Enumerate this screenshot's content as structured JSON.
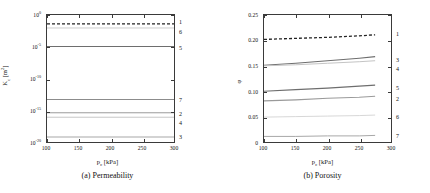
{
  "figure": {
    "panels": [
      {
        "id": "a",
        "caption": "(a) Permeability",
        "xlabel_main": "p",
        "xlabel_sub": "c",
        "xlabel_unit": "[kPa]",
        "ylabel_main": "K",
        "ylabel_sub": "c",
        "ylabel_unit": "[m",
        "ylabel_unit_sup": "2",
        "ylabel_unit_end": "]",
        "xticks": [
          "100",
          "150",
          "200",
          "250",
          "300"
        ],
        "yticks": [
          {
            "mantissa": "10",
            "exp": "0"
          },
          {
            "mantissa": "10",
            "exp": "-5"
          },
          {
            "mantissa": "10",
            "exp": "-10"
          },
          {
            "mantissa": "10",
            "exp": "-15"
          },
          {
            "mantissa": "10",
            "exp": "-20"
          }
        ],
        "curve_labels": [
          "1",
          "6",
          "5",
          "7",
          "2",
          "4",
          "3"
        ]
      },
      {
        "id": "b",
        "caption": "(b) Porosity",
        "xlabel_main": "p",
        "xlabel_sub": "c",
        "xlabel_unit": "[kPa]",
        "ylabel_main": "φ",
        "ylabel_sub": "",
        "ylabel_unit": "",
        "ylabel_unit_sup": "",
        "ylabel_unit_end": "",
        "xticks": [
          "100",
          "150",
          "200",
          "250",
          "300"
        ],
        "yticks": [
          "0.25",
          "0.20",
          "0.15",
          "0.10",
          "0.05",
          "0"
        ],
        "curve_labels": [
          "1",
          "3",
          "4",
          "5",
          "2",
          "6",
          "7"
        ]
      }
    ]
  },
  "chart_data": [
    {
      "type": "line",
      "panel": "a",
      "title": "(a) Permeability",
      "xlabel": "p_c [kPa]",
      "ylabel": "K_c [m^2]",
      "xlim": [
        100,
        300
      ],
      "ylim": [
        1e-20,
        1
      ],
      "yscale": "log",
      "xscale": "linear",
      "xticks": [
        100,
        150,
        200,
        250,
        300
      ],
      "yticks": [
        1,
        1e-05,
        1e-10,
        1e-15,
        1e-20
      ],
      "grid": false,
      "legend": "inline-right-labels",
      "x": [
        100,
        300
      ],
      "series": [
        {
          "name": "1",
          "values": [
            0.04,
            0.04
          ],
          "style": "dashed",
          "color": "#222222",
          "width": 1.3
        },
        {
          "name": "6",
          "values": [
            0.009,
            0.009
          ],
          "style": "solid",
          "color": "#c8c8c8",
          "width": 0.9
        },
        {
          "name": "5",
          "values": [
            1.1e-05,
            1.1e-05
          ],
          "style": "solid",
          "color": "#6e6e6e",
          "width": 1.1
        },
        {
          "name": "7",
          "values": [
            5e-14,
            5e-14
          ],
          "style": "solid",
          "color": "#8c8c8c",
          "width": 1.1
        },
        {
          "name": "2",
          "values": [
            4e-16,
            4e-16
          ],
          "style": "solid",
          "color": "#9a9a9a",
          "width": 1.0
        },
        {
          "name": "4",
          "values": [
            8e-17,
            8e-17
          ],
          "style": "solid",
          "color": "#c0c0c0",
          "width": 0.9
        },
        {
          "name": "3",
          "values": [
            6e-20,
            6e-20
          ],
          "style": "solid",
          "color": "#a8a8a8",
          "width": 1.1
        }
      ]
    },
    {
      "type": "line",
      "panel": "b",
      "title": "(b) Porosity",
      "xlabel": "p_c [kPa]",
      "ylabel": "φ",
      "xlim": [
        100,
        300
      ],
      "ylim": [
        0,
        0.25
      ],
      "yscale": "linear",
      "xscale": "linear",
      "xticks": [
        100,
        150,
        200,
        250,
        300
      ],
      "yticks": [
        0,
        0.05,
        0.1,
        0.15,
        0.2,
        0.25
      ],
      "grid": false,
      "legend": "inline-right-labels",
      "x": [
        100,
        150,
        200,
        250,
        275
      ],
      "series": [
        {
          "name": "1",
          "values": [
            0.202,
            0.204,
            0.206,
            0.209,
            0.211
          ],
          "style": "dashed",
          "color": "#222222",
          "width": 1.3
        },
        {
          "name": "3",
          "values": [
            0.151,
            0.155,
            0.16,
            0.165,
            0.168
          ],
          "style": "solid",
          "color": "#6e6e6e",
          "width": 1.1
        },
        {
          "name": "4",
          "values": [
            0.15,
            0.152,
            0.155,
            0.158,
            0.16
          ],
          "style": "solid",
          "color": "#c4c4c4",
          "width": 1.0
        },
        {
          "name": "5",
          "values": [
            0.1,
            0.103,
            0.106,
            0.11,
            0.112
          ],
          "style": "solid",
          "color": "#6e6e6e",
          "width": 1.1
        },
        {
          "name": "2",
          "values": [
            0.081,
            0.083,
            0.086,
            0.088,
            0.09
          ],
          "style": "solid",
          "color": "#9a9a9a",
          "width": 1.1
        },
        {
          "name": "6",
          "values": [
            0.049,
            0.05,
            0.051,
            0.052,
            0.053
          ],
          "style": "solid",
          "color": "#d2d2d2",
          "width": 0.9
        },
        {
          "name": "7",
          "values": [
            0.011,
            0.011,
            0.012,
            0.012,
            0.013
          ],
          "style": "solid",
          "color": "#a8a8a8",
          "width": 1.0
        }
      ]
    }
  ]
}
